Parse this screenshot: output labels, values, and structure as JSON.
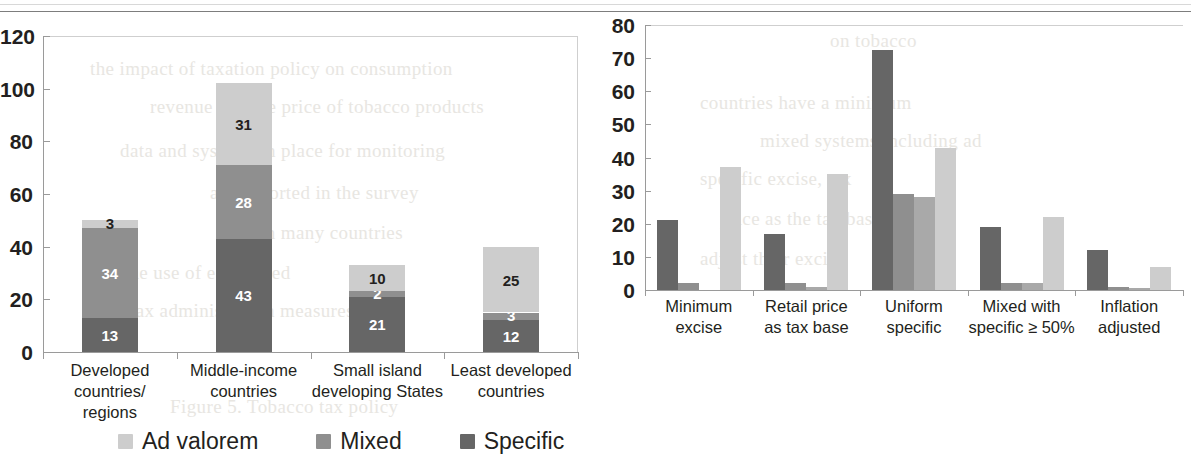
{
  "page": {
    "background_bleed_lines": [
      {
        "text": "the impact of taxation policy on consumption",
        "x": 90,
        "y": 58
      },
      {
        "text": "revenue and the price of tobacco products",
        "x": 150,
        "y": 96
      },
      {
        "text": "data and systems in place for monitoring",
        "x": 120,
        "y": 140
      },
      {
        "text": "and reported in the survey",
        "x": 210,
        "y": 182
      },
      {
        "text": "in many countries",
        "x": 260,
        "y": 222
      },
      {
        "text": "and the use of earmarked",
        "x": 90,
        "y": 262
      },
      {
        "text": "tax administration measures",
        "x": 130,
        "y": 300
      },
      {
        "text": "Figure 5. Tobacco tax policy",
        "x": 170,
        "y": 396
      },
      {
        "text": "on tobacco",
        "x": 830,
        "y": 30
      },
      {
        "text": "countries have a minimum",
        "x": 700,
        "y": 92
      },
      {
        "text": "mixed systems including ad",
        "x": 760,
        "y": 130
      },
      {
        "text": "specific excise, tax",
        "x": 700,
        "y": 168
      },
      {
        "text": "price as the tax base",
        "x": 720,
        "y": 208
      },
      {
        "text": "adjust their excise",
        "x": 700,
        "y": 248
      }
    ]
  },
  "colors": {
    "light": "#cdcdcd",
    "medium": "#8f8f8f",
    "dark": "#666666",
    "axis": "#9a9a9a",
    "rule": "#7d7d7d",
    "text": "#231f20"
  },
  "chart_data": [
    {
      "id": "left",
      "type": "bar",
      "stacked": true,
      "title": "",
      "xlabel": "",
      "ylabel": "",
      "ylim": [
        0,
        120
      ],
      "yticks": [
        0,
        20,
        40,
        60,
        80,
        100,
        120
      ],
      "grid": false,
      "legend_position": "bottom",
      "categories": [
        "Developed countries/\nregions",
        "Middle-income\ncountries",
        "Small island\ndeveloping States",
        "Least developed\ncountries"
      ],
      "series": [
        {
          "name": "Specific",
          "color_key": "dark",
          "values": [
            13,
            43,
            21,
            12
          ]
        },
        {
          "name": "Mixed",
          "color_key": "medium",
          "values": [
            34,
            28,
            2,
            3
          ]
        },
        {
          "name": "Ad valorem",
          "color_key": "light",
          "values": [
            3,
            31,
            10,
            25
          ]
        }
      ],
      "totals": [
        50,
        102,
        33,
        40
      ],
      "legend": [
        {
          "label": "Ad valorem",
          "color_key": "light"
        },
        {
          "label": "Mixed",
          "color_key": "medium"
        },
        {
          "label": "Specific",
          "color_key": "dark"
        }
      ]
    },
    {
      "id": "right",
      "type": "bar",
      "stacked": false,
      "title": "",
      "xlabel": "",
      "ylabel": "",
      "ylim": [
        0,
        80
      ],
      "yticks": [
        0,
        10,
        20,
        30,
        40,
        50,
        60,
        70,
        80
      ],
      "grid": false,
      "legend_position": "bottom",
      "categories": [
        "Minimum\nexcise",
        "Retail price\nas tax base",
        "Uniform\nspecific",
        "Mixed with\nspecific ≥ 50%",
        "Inflation\nadjusted"
      ],
      "series": [
        {
          "name": "Middle-income countries",
          "color_key": "dark",
          "values": [
            21,
            17,
            72.5,
            19,
            12
          ]
        },
        {
          "name": "Small island developing States",
          "color_key": "medium",
          "values": [
            2,
            2,
            29,
            2,
            1
          ]
        },
        {
          "name": "Least developed countries",
          "color_key": "mediumlight",
          "values": [
            0,
            1,
            28,
            2,
            0.5
          ]
        },
        {
          "name": "Developed regions",
          "color_key": "light",
          "values": [
            37,
            35,
            43,
            22,
            7
          ]
        }
      ],
      "legend": [
        {
          "label": "Middle-income\ncountries",
          "color_key": "dark"
        },
        {
          "label": "Small island\ndeveloping States",
          "color_key": "medium"
        },
        {
          "label": "Least developed\ncountries",
          "color_key": "mediumlight"
        },
        {
          "label": "Developed regions",
          "color_key": "light"
        }
      ]
    }
  ]
}
